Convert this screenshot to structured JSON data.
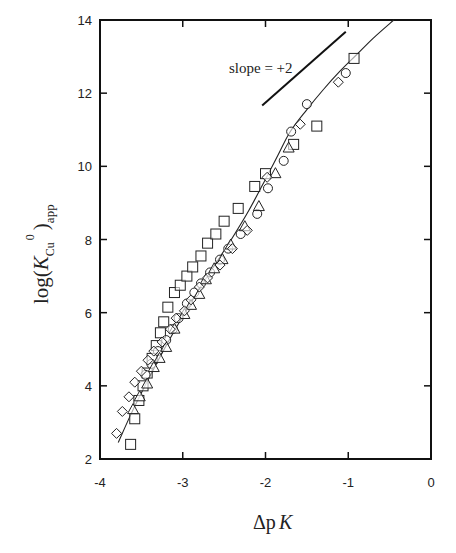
{
  "chart_data": {
    "type": "scatter",
    "title": "",
    "xlabel": "ΔpK",
    "ylabel": "log(K_Cu^0)_app",
    "xlim": [
      -4,
      0
    ],
    "ylim": [
      2,
      14
    ],
    "grid": false,
    "legend": null,
    "x_ticks": [
      -4,
      -3,
      -2,
      -1,
      0
    ],
    "x_tick_labels": [
      "-4",
      "-3",
      "-2",
      "-1",
      "0"
    ],
    "y_ticks": [
      2,
      4,
      6,
      8,
      10,
      12,
      14
    ],
    "y_tick_labels": [
      "2",
      "4",
      "6",
      "8",
      "10",
      "12",
      "14"
    ],
    "annotations": [
      {
        "text": "slope = +2",
        "x": -2.2,
        "y": 12.9
      },
      {
        "type": "reference_line",
        "label": "slope = +2",
        "x": [
          -2.04,
          -1.03
        ],
        "y": [
          11.66,
          13.68
        ]
      }
    ],
    "fit_curve": {
      "x": [
        -3.78,
        -3.6,
        -3.4,
        -3.2,
        -3.0,
        -2.8,
        -2.6,
        -2.4,
        -2.2,
        -2.0,
        -1.85,
        -1.7,
        -1.5,
        -1.3,
        -1.1,
        -0.9,
        -0.7,
        -0.45
      ],
      "y": [
        2.45,
        3.35,
        4.25,
        5.1,
        5.9,
        6.65,
        7.35,
        8.05,
        8.8,
        9.65,
        10.3,
        10.95,
        11.55,
        12.1,
        12.6,
        13.05,
        13.5,
        14.0
      ]
    },
    "series": [
      {
        "name": "squares",
        "marker": "square",
        "x": [
          -3.63,
          -3.58,
          -3.53,
          -3.48,
          -3.43,
          -3.37,
          -3.32,
          -3.27,
          -3.23,
          -3.18,
          -3.1,
          -3.03,
          -2.95,
          -2.88,
          -2.78,
          -2.7,
          -2.6,
          -2.5,
          -2.33,
          -2.13,
          -2.0,
          -1.66,
          -1.38,
          -0.93
        ],
        "y": [
          2.4,
          3.1,
          3.6,
          4.0,
          4.35,
          4.75,
          5.1,
          5.45,
          5.75,
          6.15,
          6.55,
          6.75,
          7.0,
          7.25,
          7.55,
          7.9,
          8.15,
          8.5,
          8.85,
          9.45,
          9.8,
          10.6,
          11.1,
          12.95
        ]
      },
      {
        "name": "circles",
        "marker": "circle",
        "x": [
          -3.45,
          -3.38,
          -3.3,
          -3.2,
          -3.12,
          -3.05,
          -2.95,
          -2.86,
          -2.78,
          -2.67,
          -2.55,
          -2.45,
          -2.3,
          -2.1,
          -1.97,
          -1.78,
          -1.69,
          -1.5,
          -1.03
        ],
        "y": [
          4.3,
          4.6,
          4.95,
          5.25,
          5.55,
          5.85,
          6.25,
          6.55,
          6.8,
          7.1,
          7.45,
          7.75,
          8.15,
          8.7,
          9.4,
          10.15,
          10.95,
          11.7,
          12.55
        ]
      },
      {
        "name": "triangles",
        "marker": "triangle",
        "x": [
          -3.6,
          -3.52,
          -3.43,
          -3.35,
          -3.28,
          -3.2,
          -3.1,
          -2.98,
          -2.9,
          -2.8,
          -2.72,
          -2.62,
          -2.52,
          -2.42,
          -2.25,
          -2.08,
          -1.88,
          -1.72
        ],
        "y": [
          3.35,
          3.7,
          4.05,
          4.5,
          4.75,
          5.05,
          5.55,
          5.95,
          6.2,
          6.5,
          6.9,
          7.2,
          7.45,
          7.85,
          8.35,
          8.9,
          9.8,
          10.5
        ]
      },
      {
        "name": "diamonds",
        "marker": "diamond",
        "x": [
          -3.8,
          -3.73,
          -3.65,
          -3.58,
          -3.5,
          -3.42,
          -3.35,
          -3.25,
          -3.15,
          -3.08,
          -2.98,
          -2.9,
          -2.8,
          -2.7,
          -2.55,
          -2.4,
          -2.22,
          -1.98,
          -1.58,
          -1.12
        ],
        "y": [
          2.7,
          3.3,
          3.7,
          4.1,
          4.4,
          4.7,
          4.95,
          5.2,
          5.55,
          5.85,
          6.05,
          6.35,
          6.7,
          6.95,
          7.3,
          7.75,
          8.25,
          9.7,
          11.15,
          12.3
        ]
      }
    ]
  },
  "labels": {
    "x_axis_main": "Δp",
    "x_axis_italic": "K",
    "y_axis_log": "log(",
    "y_axis_K": "K",
    "y_axis_sub": "Cu",
    "y_axis_sup": "0",
    "y_axis_close": ")",
    "y_axis_app": "app",
    "slope_annotation": "slope = +2"
  }
}
